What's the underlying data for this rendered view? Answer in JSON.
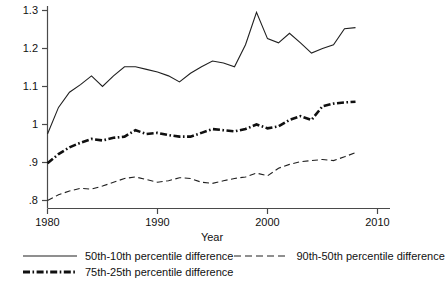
{
  "chart_data": {
    "type": "line",
    "title": "",
    "xlabel": "Year",
    "ylabel": "",
    "xlim": [
      1979,
      2010
    ],
    "ylim": [
      0.8,
      1.3
    ],
    "grid": false,
    "legend_position": "bottom",
    "x": [
      1980,
      1981,
      1982,
      1983,
      1984,
      1985,
      1986,
      1987,
      1988,
      1989,
      1990,
      1991,
      1992,
      1993,
      1994,
      1995,
      1996,
      1997,
      1998,
      1999,
      2000,
      2001,
      2002,
      2003,
      2004,
      2005,
      2006,
      2007,
      2008
    ],
    "series": [
      {
        "name": "50th-10th percentile difference",
        "style": "solid",
        "values": [
          0.975,
          1.045,
          1.085,
          1.105,
          1.128,
          1.1,
          1.128,
          1.152,
          1.152,
          1.145,
          1.138,
          1.128,
          1.112,
          1.135,
          1.152,
          1.167,
          1.162,
          1.152,
          1.21,
          1.295,
          1.226,
          1.215,
          1.24,
          1.215,
          1.188,
          1.2,
          1.21,
          1.252,
          1.255
        ]
      },
      {
        "name": "75th-25th percentile difference",
        "style": "dash-dot",
        "values": [
          0.898,
          0.922,
          0.94,
          0.952,
          0.962,
          0.958,
          0.965,
          0.968,
          0.985,
          0.975,
          0.978,
          0.972,
          0.968,
          0.968,
          0.978,
          0.988,
          0.985,
          0.982,
          0.988,
          1.0,
          0.99,
          0.995,
          1.012,
          1.022,
          1.012,
          1.048,
          1.055,
          1.058,
          1.06
        ]
      },
      {
        "name": "90th-50th percentile difference",
        "style": "dashed",
        "values": [
          0.8,
          0.815,
          0.825,
          0.832,
          0.83,
          0.838,
          0.848,
          0.858,
          0.862,
          0.855,
          0.848,
          0.852,
          0.86,
          0.858,
          0.848,
          0.845,
          0.852,
          0.858,
          0.862,
          0.872,
          0.865,
          0.885,
          0.895,
          0.902,
          0.905,
          0.908,
          0.905,
          0.915,
          0.926
        ]
      }
    ],
    "y_ticks": [
      "1.3",
      "1.2",
      "1.1",
      "1",
      ".9",
      ".8"
    ],
    "y_tick_values": [
      1.3,
      1.2,
      1.1,
      1.0,
      0.9,
      0.8
    ],
    "x_ticks": [
      "1980",
      "1990",
      "2000",
      "2010"
    ],
    "x_tick_values": [
      1980,
      1990,
      2000,
      2010
    ]
  },
  "legend": {
    "items": [
      {
        "label": "50th-10th percentile difference",
        "style": "solid"
      },
      {
        "label": "90th-50th percentile difference",
        "style": "dashed"
      },
      {
        "label": "75th-25th percentile difference",
        "style": "dash-dot"
      }
    ]
  },
  "colors": {
    "line": "#202020",
    "axis": "#4a4a4a",
    "background": "#ffffff"
  }
}
